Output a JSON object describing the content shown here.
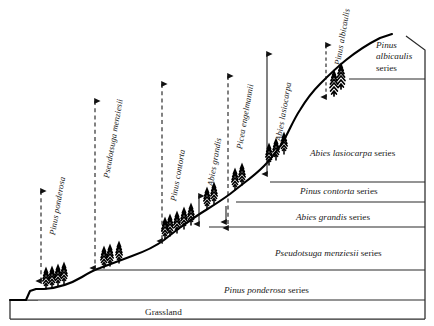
{
  "figure": {
    "kind": "elevation-vegetation-zonation-diagram",
    "baseline_label": "Grassland"
  },
  "species_ranges": [
    {
      "name": "Pinus ponderosa",
      "arrow": "dashed",
      "x": 41,
      "label_x": 47,
      "label_y": 234,
      "top": 191,
      "bottom": 281
    },
    {
      "name": "Pseudotsuga menziesii",
      "arrow": "dashed",
      "x": 95,
      "label_x": 101,
      "label_y": 177,
      "top": 101,
      "bottom": 268
    },
    {
      "name": "Pinus contorta",
      "arrow": "dashed",
      "x": 162,
      "label_x": 168,
      "label_y": 200,
      "top": 84,
      "bottom": 241
    },
    {
      "name": "Abies grandis",
      "arrow": "solid",
      "x": 199,
      "label_x": 205,
      "label_y": 185,
      "top": 196,
      "bottom": 224
    },
    {
      "name": "Picea engelmannii",
      "arrow": "dashed",
      "x": 228,
      "label_x": 234,
      "label_y": 148,
      "top": 76,
      "bottom": 228
    },
    {
      "name": "Abies lasiocarpa",
      "arrow": "solid",
      "x": 267,
      "label_x": 273,
      "label_y": 140,
      "top": 54,
      "bottom": 174
    },
    {
      "name": "Pinus albicaulis",
      "arrow": "dashed",
      "x": 326,
      "label_x": 332,
      "label_y": 64,
      "top": 45,
      "bottom": 97
    }
  ],
  "zones": [
    {
      "id": "albicaulis",
      "lines": [
        "Pinus",
        "albicaulis",
        "series"
      ],
      "x": 376,
      "y": 40,
      "stacked": true
    },
    {
      "id": "lasiocarpa",
      "italic": "Abies lasiocarpa",
      "rest": " series",
      "x": 310,
      "y": 148,
      "stacked": false
    },
    {
      "id": "contorta",
      "italic": "Pinus contorta",
      "rest": " series",
      "x": 300,
      "y": 186,
      "stacked": false
    },
    {
      "id": "grandis",
      "italic": "Abies grandis",
      "rest": " series",
      "x": 296,
      "y": 212,
      "stacked": false
    },
    {
      "id": "menziesii",
      "italic": "Pseudotsuga menziesii",
      "rest": " series",
      "x": 275,
      "y": 248,
      "stacked": false
    },
    {
      "id": "ponderosa",
      "italic": "Pinus ponderosa",
      "rest": " series",
      "x": 224,
      "y": 285,
      "stacked": false
    },
    {
      "id": "grassland",
      "italic": "",
      "rest": "Grassland",
      "x": 145,
      "y": 307,
      "stacked": false
    }
  ],
  "colors": {
    "ink": "#1a1a1a",
    "terrain": "#000000",
    "rule": "#2b2b2b",
    "arrow": "#111111"
  }
}
